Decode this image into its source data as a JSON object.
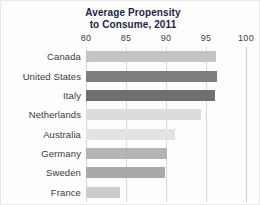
{
  "chart_data": {
    "type": "bar",
    "orientation": "horizontal",
    "title": "Average Propensity to Consume, 2011",
    "title_lines": [
      "Average Propensity",
      "to Consume, 2011"
    ],
    "xlabel": "",
    "ylabel": "",
    "xlim": [
      80,
      100
    ],
    "xticks": [
      80,
      85,
      90,
      95,
      100
    ],
    "xtick_labels": [
      "80",
      "85",
      "90",
      "95",
      "100"
    ],
    "grid": true,
    "grid_axis": "x",
    "legend": false,
    "categories": [
      "Canada",
      "United States",
      "Italy",
      "Netherlands",
      "Australia",
      "Germany",
      "Sweden",
      "France"
    ],
    "values": [
      96.3,
      96.4,
      96.1,
      94.4,
      91.1,
      90.1,
      89.9,
      84.2
    ],
    "bar_colors": [
      "#c3c3c3",
      "#7e7e7e",
      "#6f6f6f",
      "#dcdcdc",
      "#e3e3e3",
      "#b4b4b4",
      "#a9a9a9",
      "#cccccc"
    ],
    "bars": [
      {
        "label": "Canada",
        "value": 96.3,
        "color": "#c3c3c3"
      },
      {
        "label": "United States",
        "value": 96.4,
        "color": "#7e7e7e"
      },
      {
        "label": "Italy",
        "value": 96.1,
        "color": "#6f6f6f"
      },
      {
        "label": "Netherlands",
        "value": 94.4,
        "color": "#dcdcdc"
      },
      {
        "label": "Australia",
        "value": 91.1,
        "color": "#e3e3e3"
      },
      {
        "label": "Germany",
        "value": 90.1,
        "color": "#b4b4b4"
      },
      {
        "label": "Sweden",
        "value": 89.9,
        "color": "#a9a9a9"
      },
      {
        "label": "France",
        "value": 84.2,
        "color": "#cccccc"
      }
    ],
    "title_color": "#231f45",
    "grid_color": "#d6d6d6",
    "background_color": "#fdfdfd"
  }
}
